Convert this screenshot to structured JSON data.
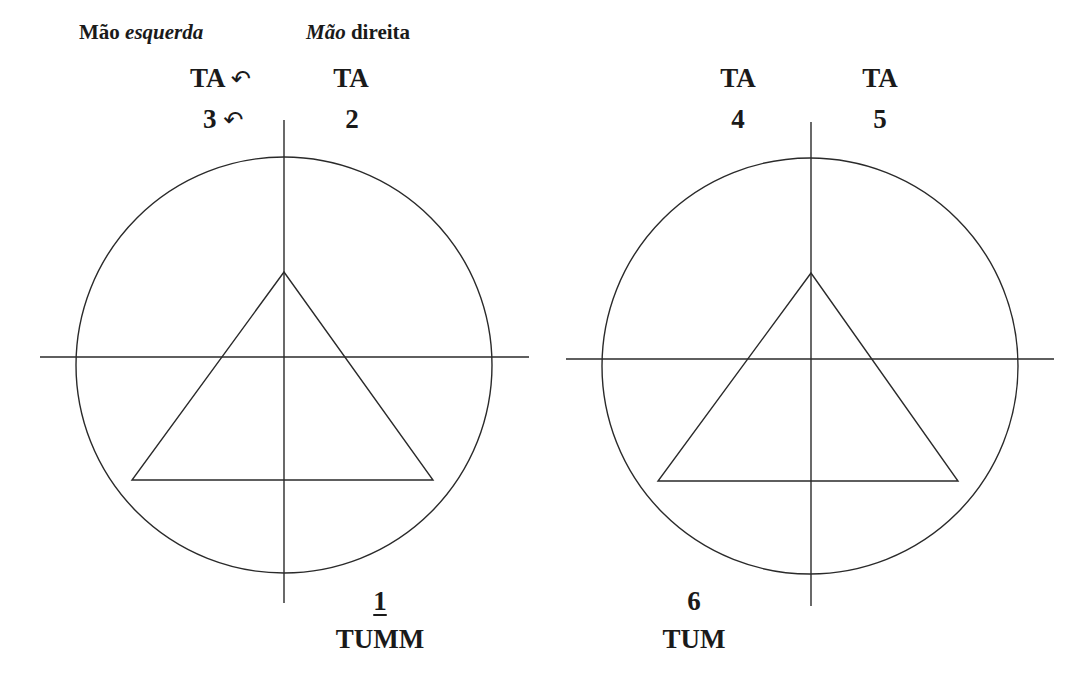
{
  "header": {
    "left_hand": {
      "word1": "Mão",
      "word2": "esquerda",
      "italic": "word2"
    },
    "right_hand": {
      "word1": "Mão",
      "word2": "direita",
      "italic": "word1"
    }
  },
  "diagrams": [
    {
      "id": "left",
      "labels": {
        "top_left_syllable": "TA",
        "top_left_count": "3",
        "top_left_arrow": "↶",
        "top_left_count_arrow": "↶",
        "top_right_syllable": "TA",
        "top_right_count": "2",
        "bottom_count": "1",
        "bottom_syllable": "TUMM"
      },
      "geometry": {
        "circle": {
          "cx": 284,
          "cy": 365,
          "r": 208
        },
        "vertical_axis": {
          "x": 284,
          "y1": 120,
          "y2": 603
        },
        "horizontal_axis": {
          "y": 357,
          "x1": 40,
          "x2": 529
        },
        "triangle": [
          [
            284,
            272
          ],
          [
            132,
            480
          ],
          [
            433,
            480
          ]
        ]
      }
    },
    {
      "id": "right",
      "labels": {
        "top_left_syllable": "TA",
        "top_left_count": "4",
        "top_right_syllable": "TA",
        "top_right_count": "5",
        "bottom_count": "6",
        "bottom_syllable": "TUM"
      },
      "geometry": {
        "circle": {
          "cx": 810,
          "cy": 366,
          "r": 208
        },
        "vertical_axis": {
          "x": 811,
          "y1": 122,
          "y2": 606
        },
        "horizontal_axis": {
          "y": 359,
          "x1": 566,
          "x2": 1054
        },
        "triangle": [
          [
            811,
            273
          ],
          [
            658,
            481
          ],
          [
            958,
            481
          ]
        ]
      }
    }
  ],
  "style": {
    "stroke_color": "#2a2a2a",
    "text_color": "#1a1a1a",
    "background": "#ffffff"
  }
}
